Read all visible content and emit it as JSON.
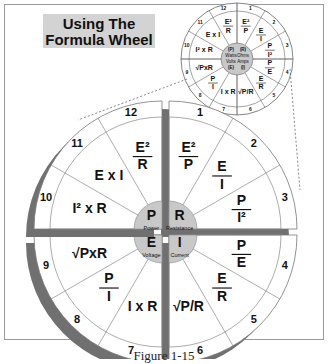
{
  "title": {
    "line1": "Using The",
    "line2": "Formula Wheel"
  },
  "caption": "Figure 1-15",
  "colors": {
    "hub": "#c8c8c8",
    "shadow": "#707070",
    "title_bg": "#d3d3d3",
    "line": "#888888"
  },
  "small_wheel": {
    "hub": {
      "top_left": "(P)",
      "top_right": "(R)",
      "mid1": "Watts",
      "mid2": "Ohms",
      "mid3": "Volts",
      "mid4": "Amps",
      "bottom_left": "(E)",
      "bottom_right": "(I)"
    }
  },
  "segments": [
    {
      "n": "1",
      "formula": "E²/P",
      "num": "E²",
      "den": "P"
    },
    {
      "n": "2",
      "formula": "E/I",
      "num": "E",
      "den": "I"
    },
    {
      "n": "3",
      "formula": "P/I²",
      "num": "P",
      "den": "I²"
    },
    {
      "n": "4",
      "formula": "P/E",
      "num": "P",
      "den": "E"
    },
    {
      "n": "5",
      "formula": "E/R",
      "num": "E",
      "den": "R"
    },
    {
      "n": "6",
      "formula": "√P/R",
      "text": "√P/R"
    },
    {
      "n": "7",
      "formula": "I x R",
      "text": "I x R"
    },
    {
      "n": "8",
      "formula": "P/I",
      "num": "P",
      "den": "I"
    },
    {
      "n": "9",
      "formula": "√PxR",
      "text": "√PxR"
    },
    {
      "n": "10",
      "formula": "I² x R",
      "text": "I² x R"
    },
    {
      "n": "11",
      "formula": "E x I",
      "text": "E x I"
    },
    {
      "n": "12",
      "formula": "E²/R",
      "num": "E²",
      "den": "R"
    }
  ],
  "quadrants": {
    "power": {
      "letter": "P",
      "label": "Power"
    },
    "resistance": {
      "letter": "R",
      "label": "Resistance"
    },
    "voltage": {
      "letter": "E",
      "label": "Voltage"
    },
    "current": {
      "letter": "I",
      "label": "Current"
    }
  }
}
